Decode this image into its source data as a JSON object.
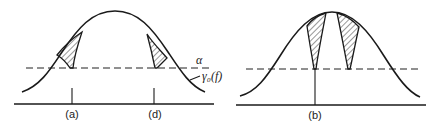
{
  "figure": {
    "panels": [
      {
        "id": "left",
        "markers": [
          {
            "label": "(a)"
          },
          {
            "label": "(d)"
          }
        ],
        "threshold_label": "α",
        "curve_label": "γ₀(f)"
      },
      {
        "id": "right",
        "markers": [
          {
            "label": "(b)"
          }
        ]
      }
    ]
  }
}
